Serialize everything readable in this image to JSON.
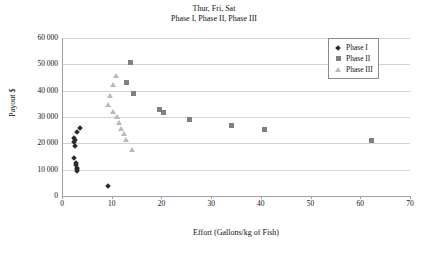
{
  "chart_data": {
    "type": "scatter",
    "title": "Thur, Fri, Sat",
    "subtitle": "Phase I, Phase II, Phase III",
    "xlabel": "Effort (Gallons/kg of Fish)",
    "ylabel": "Payout $",
    "xlim": [
      0,
      70
    ],
    "ylim": [
      0,
      60000
    ],
    "xticks": [
      0,
      10,
      20,
      30,
      40,
      50,
      60,
      70
    ],
    "xtick_labels": [
      "0",
      "10",
      "20",
      "30",
      "40",
      "50",
      "60",
      "70"
    ],
    "yticks": [
      0,
      10000,
      20000,
      30000,
      40000,
      50000,
      60000
    ],
    "ytick_labels": [
      "0",
      "10 000",
      "20 000",
      "30 000",
      "40 000",
      "50 000",
      "60 000"
    ],
    "grid": "horizontal",
    "legend_position": "top-right",
    "series": [
      {
        "name": "Phase I",
        "marker": "diamond",
        "color": "#2b2b2b",
        "points": [
          {
            "x": 3.6,
            "y": 25800
          },
          {
            "x": 3.0,
            "y": 24300
          },
          {
            "x": 2.5,
            "y": 22100
          },
          {
            "x": 2.6,
            "y": 21300
          },
          {
            "x": 2.5,
            "y": 20500
          },
          {
            "x": 2.6,
            "y": 19100
          },
          {
            "x": 2.4,
            "y": 14300
          },
          {
            "x": 2.8,
            "y": 12400
          },
          {
            "x": 2.9,
            "y": 11600
          },
          {
            "x": 3.0,
            "y": 10800
          },
          {
            "x": 3.0,
            "y": 10100
          },
          {
            "x": 3.1,
            "y": 9500
          },
          {
            "x": 9.2,
            "y": 3700
          }
        ]
      },
      {
        "name": "Phase II",
        "marker": "square",
        "color": "#808080",
        "points": [
          {
            "x": 13.8,
            "y": 50800
          },
          {
            "x": 13.0,
            "y": 43200
          },
          {
            "x": 14.3,
            "y": 38900
          },
          {
            "x": 19.6,
            "y": 32900
          },
          {
            "x": 20.4,
            "y": 31600
          },
          {
            "x": 25.6,
            "y": 28900
          },
          {
            "x": 34.0,
            "y": 26800
          },
          {
            "x": 40.7,
            "y": 25400
          },
          {
            "x": 62.2,
            "y": 21000
          }
        ]
      },
      {
        "name": "Phase III",
        "marker": "triangle",
        "color": "#b9b9b9",
        "points": [
          {
            "x": 10.8,
            "y": 45800
          },
          {
            "x": 10.2,
            "y": 42200
          },
          {
            "x": 9.6,
            "y": 38200
          },
          {
            "x": 9.3,
            "y": 34700
          },
          {
            "x": 10.2,
            "y": 32100
          },
          {
            "x": 11.0,
            "y": 30200
          },
          {
            "x": 11.4,
            "y": 27900
          },
          {
            "x": 11.9,
            "y": 25600
          },
          {
            "x": 12.4,
            "y": 23900
          },
          {
            "x": 12.9,
            "y": 21600
          },
          {
            "x": 14.1,
            "y": 17500
          }
        ]
      }
    ]
  },
  "legend": {
    "items": [
      {
        "label": "Phase I"
      },
      {
        "label": "Phase II"
      },
      {
        "label": "Phase III"
      }
    ]
  }
}
